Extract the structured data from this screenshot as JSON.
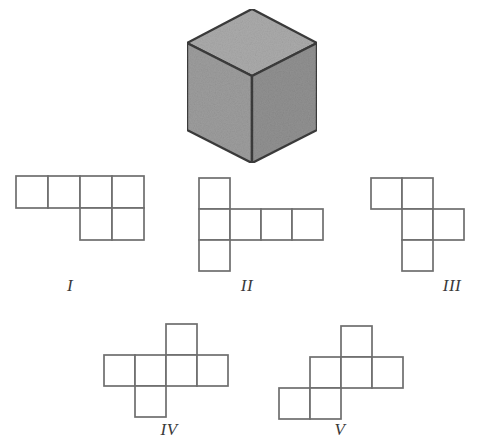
{
  "figure": {
    "title": "",
    "background_color": "#ffffff"
  },
  "cube": {
    "name": "gray-cube",
    "colors": {
      "top_face": "#a8a8a8",
      "left_face": "#9a9a9a",
      "right_face": "#8e8e8e",
      "outline": "#3a3a3a"
    },
    "geometry": {
      "top_vertices": "66,0 132,34 66,68 0,34",
      "left_vertices": "0,34 66,68 66,156 0,122",
      "right_vertices": "66,68 132,34 132,122 66,156"
    }
  },
  "net_style": {
    "stroke_color": "#6b6b6b",
    "stroke_width": 1.6,
    "fill_color": "#ffffff",
    "cell_size": 32
  },
  "nets": [
    {
      "id": "net-i",
      "label": "I",
      "cell_size": 32,
      "square_count": 6,
      "width": 130,
      "height": 70,
      "cells": [
        {
          "col": 0,
          "row": 0
        },
        {
          "col": 1,
          "row": 0
        },
        {
          "col": 2,
          "row": 0
        },
        {
          "col": 3,
          "row": 0
        },
        {
          "col": 2,
          "row": 1
        },
        {
          "col": 3,
          "row": 1
        }
      ]
    },
    {
      "id": "net-ii",
      "label": "II",
      "cell_size": 31,
      "square_count": 6,
      "width": 128,
      "height": 97,
      "cells": [
        {
          "col": 0,
          "row": 0
        },
        {
          "col": 0,
          "row": 1
        },
        {
          "col": 1,
          "row": 1
        },
        {
          "col": 2,
          "row": 1
        },
        {
          "col": 3,
          "row": 1
        },
        {
          "col": 0,
          "row": 2
        }
      ]
    },
    {
      "id": "net-iii",
      "label": "III",
      "cell_size": 31,
      "square_count": 6,
      "width": 97,
      "height": 97,
      "cells": [
        {
          "col": 0,
          "row": 0
        },
        {
          "col": 1,
          "row": 0
        },
        {
          "col": 1,
          "row": 1
        },
        {
          "col": 2,
          "row": 1
        },
        {
          "col": 1,
          "row": 2
        }
      ]
    },
    {
      "id": "net-iv",
      "label": "IV",
      "cell_size": 31,
      "square_count": 6,
      "width": 128,
      "height": 94,
      "cells": [
        {
          "col": 2,
          "row": 0
        },
        {
          "col": 0,
          "row": 1
        },
        {
          "col": 1,
          "row": 1
        },
        {
          "col": 2,
          "row": 1
        },
        {
          "col": 3,
          "row": 1
        },
        {
          "col": 1,
          "row": 2
        }
      ]
    },
    {
      "id": "net-v",
      "label": "V",
      "cell_size": 31,
      "square_count": 6,
      "width": 128,
      "height": 94,
      "cells": [
        {
          "col": 2,
          "row": 0
        },
        {
          "col": 1,
          "row": 1
        },
        {
          "col": 2,
          "row": 1
        },
        {
          "col": 3,
          "row": 1
        },
        {
          "col": 0,
          "row": 2
        },
        {
          "col": 1,
          "row": 2
        }
      ]
    }
  ]
}
